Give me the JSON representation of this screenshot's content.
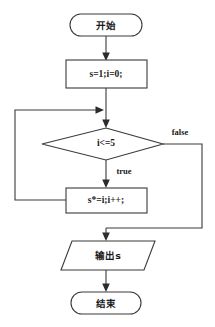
{
  "diagram": {
    "title": "",
    "type": "flowchart",
    "orientation": "top-to-bottom",
    "colors": {
      "background": "#ffffff",
      "stroke": "#3a3a3a",
      "text": "#1a1a1a",
      "shape_fill": "#ffffff"
    },
    "nodes": [
      {
        "id": "start",
        "shape": "terminator",
        "label": "开始"
      },
      {
        "id": "init",
        "shape": "process",
        "label": "s=1;i=0;"
      },
      {
        "id": "condition",
        "shape": "decision",
        "label": "i<=5"
      },
      {
        "id": "body",
        "shape": "process",
        "label": "s*=i;i++;"
      },
      {
        "id": "output",
        "shape": "parallelogram",
        "label": "输出s"
      },
      {
        "id": "end",
        "shape": "terminator",
        "label": "结束"
      }
    ],
    "edges": [
      {
        "id": "e-start-init",
        "from": "start",
        "to": "init",
        "label": ""
      },
      {
        "id": "e-init-condition",
        "from": "init",
        "to": "condition",
        "label": ""
      },
      {
        "id": "e-condition-body",
        "from": "condition",
        "to": "body",
        "label": "true"
      },
      {
        "id": "e-condition-output",
        "from": "condition",
        "to": "output",
        "label": "false"
      },
      {
        "id": "e-body-loopback",
        "from": "body",
        "to": "condition",
        "label": ""
      },
      {
        "id": "e-output-end",
        "from": "output",
        "to": "end",
        "label": ""
      }
    ],
    "edge_labels": {
      "true": "true",
      "false": "false"
    }
  }
}
